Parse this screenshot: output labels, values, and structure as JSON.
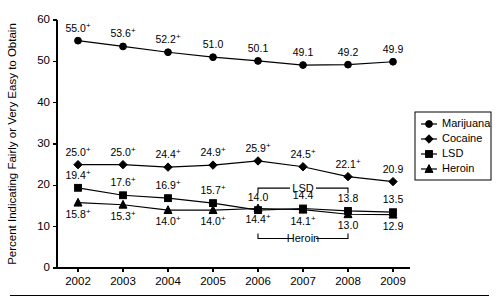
{
  "chart_data": {
    "type": "line",
    "title": "",
    "subtitle": "",
    "xlabel": "",
    "ylabel": "Percent Indicating Fairly or Very Easy to Obtain",
    "categories": [
      "2002",
      "2003",
      "2004",
      "2005",
      "2006",
      "2007",
      "2008",
      "2009"
    ],
    "x": [
      2002,
      2003,
      2004,
      2005,
      2006,
      2007,
      2008,
      2009
    ],
    "ylim": [
      0,
      60
    ],
    "yticks": [
      0,
      10,
      20,
      30,
      40,
      50,
      60
    ],
    "ytick_labels": [
      "0",
      "10",
      "20",
      "30",
      "40",
      "50",
      "60"
    ],
    "grid": false,
    "legend_position": "right",
    "series": [
      {
        "name": "Marijuana",
        "marker": "circle",
        "values": [
          55.0,
          53.6,
          52.2,
          51.0,
          50.1,
          49.1,
          49.2,
          49.9
        ],
        "labels": [
          "55.0",
          "53.6",
          "52.2",
          "51.0",
          "50.1",
          "49.1",
          "49.2",
          "49.9"
        ],
        "significance": [
          "+",
          "+",
          "+",
          "",
          "",
          "",
          "",
          ""
        ],
        "label_positions": [
          "above",
          "above",
          "above",
          "above",
          "above",
          "above",
          "above",
          "above"
        ]
      },
      {
        "name": "Cocaine",
        "marker": "diamond",
        "values": [
          25.0,
          25.0,
          24.4,
          24.9,
          25.9,
          24.5,
          22.1,
          20.9
        ],
        "labels": [
          "25.0",
          "25.0",
          "24.4",
          "24.9",
          "25.9",
          "24.5",
          "22.1",
          "20.9"
        ],
        "significance": [
          "+",
          "+",
          "+",
          "+",
          "+",
          "+",
          "+",
          ""
        ],
        "label_positions": [
          "above",
          "above",
          "above",
          "above",
          "above",
          "above",
          "above",
          "above"
        ]
      },
      {
        "name": "LSD",
        "marker": "square",
        "values": [
          19.4,
          17.6,
          16.9,
          15.7,
          14.0,
          14.4,
          13.8,
          13.5
        ],
        "labels": [
          "19.4",
          "17.6",
          "16.9",
          "15.7",
          "14.0",
          "14.4",
          "13.8",
          "13.5"
        ],
        "significance": [
          "+",
          "+",
          "+",
          "+",
          "",
          "",
          "",
          ""
        ],
        "label_positions": [
          "above",
          "above",
          "above",
          "above",
          "above",
          "above",
          "above",
          "above"
        ]
      },
      {
        "name": "Heroin",
        "marker": "triangle",
        "values": [
          15.8,
          15.3,
          14.0,
          14.0,
          14.4,
          14.1,
          13.0,
          12.9
        ],
        "labels": [
          "15.8",
          "15.3",
          "14.0",
          "14.0",
          "14.4",
          "14.1",
          "13.0",
          "12.9"
        ],
        "significance": [
          "+",
          "+",
          "+",
          "+",
          "+",
          "+",
          "",
          ""
        ],
        "label_positions": [
          "below",
          "below",
          "below",
          "below",
          "below",
          "below",
          "below",
          "below"
        ]
      }
    ],
    "annotations": [
      {
        "text": "LSD",
        "from": "2006",
        "to": "2008",
        "side": "above",
        "series": "LSD"
      },
      {
        "text": "Heroin",
        "from": "2006",
        "to": "2008",
        "side": "below",
        "series": "Heroin"
      }
    ]
  },
  "legend": {
    "items": [
      {
        "label": "Marijuana",
        "marker": "circle"
      },
      {
        "label": "Cocaine",
        "marker": "diamond"
      },
      {
        "label": "LSD",
        "marker": "square"
      },
      {
        "label": "Heroin",
        "marker": "triangle"
      }
    ]
  },
  "colors": {
    "ink": "#000000",
    "background": "#ffffff"
  }
}
